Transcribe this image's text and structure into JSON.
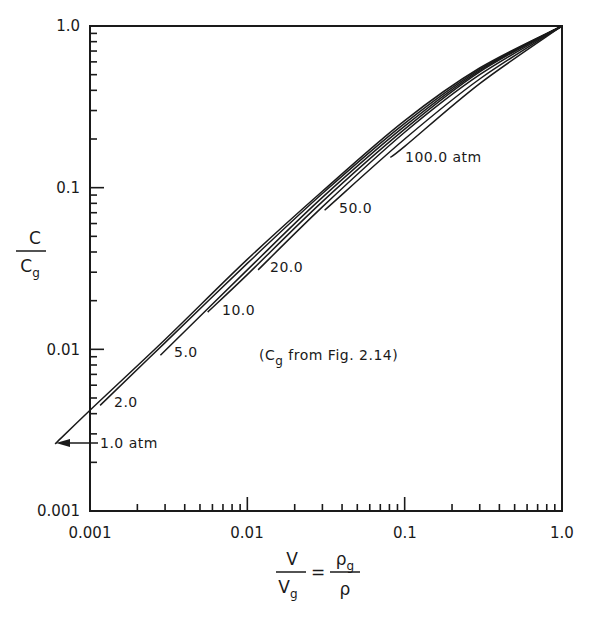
{
  "chart_data": {
    "type": "line",
    "title": "",
    "xscale": "log",
    "yscale": "log",
    "xlim": [
      0.001,
      1.0
    ],
    "ylim": [
      0.001,
      1.0
    ],
    "xticks": [
      "0.001",
      "0.01",
      "0.1",
      "1.0"
    ],
    "yticks": [
      "0.001",
      "0.01",
      "0.1",
      "1.0"
    ],
    "xlabel": "V/Vg = ρg/ρ",
    "ylabel": "C/Cg",
    "grid": false,
    "annotation": "(Cg from Fig. 2.14)",
    "series": [
      {
        "name": "1.0 atm",
        "label": "1.0 atm",
        "points": [
          [
            0.0006,
            0.0026
          ],
          [
            0.001,
            0.0042
          ],
          [
            0.003,
            0.0115
          ],
          [
            0.01,
            0.036
          ],
          [
            0.03,
            0.095
          ],
          [
            0.1,
            0.26
          ],
          [
            0.3,
            0.55
          ],
          [
            1.0,
            1.0
          ]
        ]
      },
      {
        "name": "2.0 atm",
        "label": "2.0",
        "points": [
          [
            0.00116,
            0.0045
          ],
          [
            0.003,
            0.011
          ],
          [
            0.01,
            0.034
          ],
          [
            0.03,
            0.092
          ],
          [
            0.1,
            0.25
          ],
          [
            0.3,
            0.54
          ],
          [
            1.0,
            1.0
          ]
        ]
      },
      {
        "name": "5.0 atm",
        "label": "5.0",
        "points": [
          [
            0.0028,
            0.0092
          ],
          [
            0.01,
            0.031
          ],
          [
            0.03,
            0.087
          ],
          [
            0.1,
            0.24
          ],
          [
            0.3,
            0.53
          ],
          [
            1.0,
            1.0
          ]
        ]
      },
      {
        "name": "10.0 atm",
        "label": "10.0",
        "points": [
          [
            0.0056,
            0.017
          ],
          [
            0.01,
            0.029
          ],
          [
            0.03,
            0.082
          ],
          [
            0.1,
            0.23
          ],
          [
            0.3,
            0.52
          ],
          [
            1.0,
            1.0
          ]
        ]
      },
      {
        "name": "20.0 atm",
        "label": "20.0",
        "points": [
          [
            0.0117,
            0.031
          ],
          [
            0.03,
            0.076
          ],
          [
            0.1,
            0.22
          ],
          [
            0.3,
            0.5
          ],
          [
            1.0,
            1.0
          ]
        ]
      },
      {
        "name": "50.0 atm",
        "label": "50.0",
        "points": [
          [
            0.031,
            0.0725
          ],
          [
            0.1,
            0.2
          ],
          [
            0.3,
            0.47
          ],
          [
            1.0,
            1.0
          ]
        ]
      },
      {
        "name": "100.0 atm",
        "label": "100.0 atm",
        "points": [
          [
            0.081,
            0.154
          ],
          [
            0.1,
            0.18
          ],
          [
            0.3,
            0.44
          ],
          [
            1.0,
            1.0
          ]
        ]
      }
    ]
  },
  "labels": {
    "x_ticks": [
      "0.001",
      "0.01",
      "0.1",
      "1.0"
    ],
    "y_ticks": [
      "1.0",
      "0.1",
      "0.01",
      "0.001"
    ],
    "ylabel_num": "C",
    "ylabel_den": "C",
    "ylabel_den_sub": "g",
    "xlabel_left_num": "V",
    "xlabel_left_den": "V",
    "xlabel_left_den_sub": "g",
    "xlabel_eq": "=",
    "xlabel_right_num": "ρ",
    "xlabel_right_num_sub": "g",
    "xlabel_right_den": "ρ",
    "curve_1": "1.0 atm",
    "curve_2": "2.0",
    "curve_5": "5.0",
    "curve_10": "10.0",
    "curve_20": "20.0",
    "curve_50": "50.0",
    "curve_100": "100.0 atm",
    "note_prefix": "(C",
    "note_sub": "g",
    "note_suffix": " from  Fig. 2.14)"
  }
}
